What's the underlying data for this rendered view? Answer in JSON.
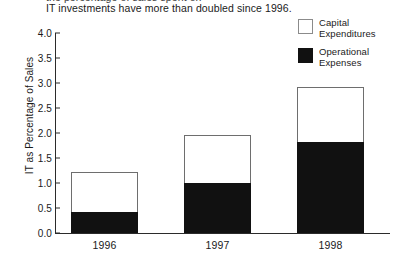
{
  "caption": {
    "previous_line_partial": "the percentage of sales spent on",
    "text": "IT investments have more than doubled since 1996."
  },
  "legend": {
    "items": [
      {
        "label": "Capital\nExpenditures",
        "label_line1": "Capital",
        "label_line2": "Expenditures",
        "color": "#ffffff",
        "border": "#8b8b8b"
      },
      {
        "label": "Operational\nExpenses",
        "label_line1": "Operational",
        "label_line2": "Expenses",
        "color": "#111111",
        "border": "#111111"
      }
    ]
  },
  "chart_data": {
    "type": "bar",
    "stacked": true,
    "title": "",
    "subtitle": "",
    "xlabel": "",
    "ylabel": "IT as Percentage of Sales",
    "categories": [
      "1996",
      "1997",
      "1998"
    ],
    "series": [
      {
        "name": "Operational Expenses",
        "color": "#111111",
        "values": [
          0.42,
          1.0,
          1.83
        ]
      },
      {
        "name": "Capital Expenditures",
        "color": "#ffffff",
        "values": [
          0.8,
          0.97,
          1.1
        ]
      }
    ],
    "totals": [
      1.22,
      1.97,
      2.93
    ],
    "ylim": [
      0.0,
      4.0
    ],
    "ytick_values": [
      0.0,
      0.5,
      1.0,
      1.5,
      2.0,
      2.5,
      3.0,
      3.5,
      4.0
    ],
    "ytick_labels": [
      "0.0",
      "0.5",
      "1.0",
      "1.5",
      "2.0",
      "2.5",
      "3.0",
      "3.5",
      "4.0"
    ],
    "grid": false,
    "legend_position": "top-right"
  }
}
